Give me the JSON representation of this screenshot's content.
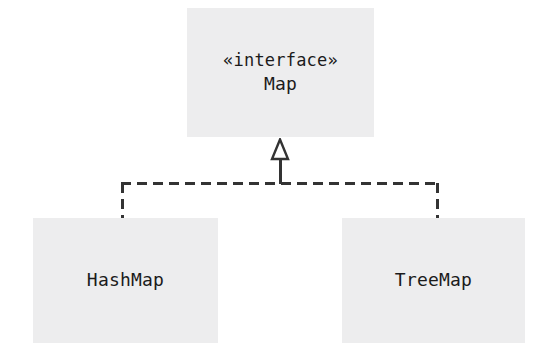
{
  "diagram": {
    "type": "uml-class-diagram",
    "background_color": "#ffffff",
    "box_fill_color": "#ededee",
    "line_color": "#333333",
    "text_color": "#1b1b1b",
    "nodes": [
      {
        "id": "map",
        "stereotype": "«interface»",
        "name": "Map",
        "role": "interface"
      },
      {
        "id": "hashmap",
        "name": "HashMap",
        "role": "class"
      },
      {
        "id": "treemap",
        "name": "TreeMap",
        "role": "class"
      }
    ],
    "relationships": [
      {
        "from": "HashMap",
        "to": "Map",
        "kind": "realization",
        "line_style": "dashed",
        "arrowhead": "hollow-triangle"
      },
      {
        "from": "TreeMap",
        "to": "Map",
        "kind": "realization",
        "line_style": "dashed",
        "arrowhead": "hollow-triangle"
      }
    ]
  }
}
